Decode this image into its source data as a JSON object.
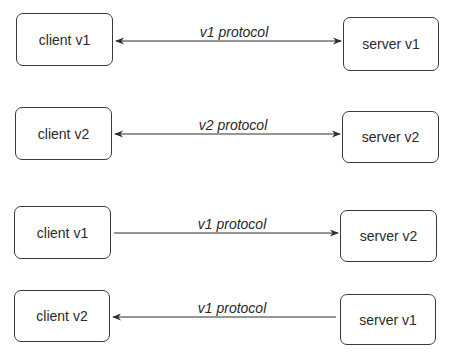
{
  "diagram": {
    "rows": [
      {
        "client": {
          "label": "client v1",
          "x": 16,
          "y": 13,
          "w": 97,
          "h": 53
        },
        "server": {
          "label": "server v1",
          "x": 343,
          "y": 17,
          "w": 96,
          "h": 54
        },
        "connection": {
          "label": "v1 protocol",
          "direction": "bidirectional",
          "x1": 116,
          "x2": 341,
          "y": 41,
          "label_x": 234,
          "label_y": 24
        }
      },
      {
        "client": {
          "label": "client v2",
          "x": 15,
          "y": 107,
          "w": 97,
          "h": 53
        },
        "server": {
          "label": "server v2",
          "x": 342,
          "y": 111,
          "w": 97,
          "h": 52
        },
        "connection": {
          "label": "v2 protocol",
          "direction": "bidirectional",
          "x1": 115,
          "x2": 340,
          "y": 134,
          "label_x": 233,
          "label_y": 117
        }
      },
      {
        "client": {
          "label": "client v1",
          "x": 14,
          "y": 206,
          "w": 97,
          "h": 53
        },
        "server": {
          "label": "server v2",
          "x": 340,
          "y": 210,
          "w": 97,
          "h": 52
        },
        "connection": {
          "label": "v1 protocol",
          "direction": "client-to-server",
          "x1": 114,
          "x2": 338,
          "y": 233,
          "label_x": 232,
          "label_y": 216
        }
      },
      {
        "client": {
          "label": "client v2",
          "x": 14,
          "y": 290,
          "w": 96,
          "h": 52
        },
        "server": {
          "label": "server v1",
          "x": 340,
          "y": 294,
          "w": 96,
          "h": 51
        },
        "connection": {
          "label": "v1 protocol",
          "direction": "server-to-client",
          "x1": 113,
          "x2": 336,
          "y": 317,
          "label_x": 232,
          "label_y": 300
        }
      }
    ]
  },
  "colors": {
    "stroke": "#2e2e2e",
    "text": "#2a2a2a",
    "background": "#ffffff"
  }
}
